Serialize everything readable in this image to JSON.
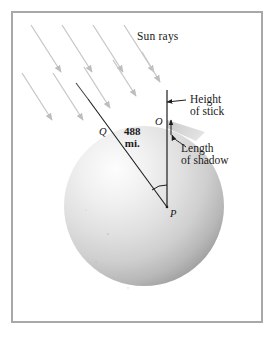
{
  "figure": {
    "frame_color": "#a8a8a8",
    "background_color": "#ffffff",
    "labels": {
      "sun_rays": "Sun rays",
      "height_line1": "Height",
      "height_line2": "of stick",
      "shadow_line1": "Length",
      "shadow_line2": "of shadow",
      "distance_value": "488",
      "distance_unit": "mi."
    },
    "points": {
      "q": "Q",
      "o": "O",
      "p": "P"
    },
    "sphere": {
      "center_x": 144,
      "center_y": 206,
      "radius": 80,
      "fill_light": "#fbfbfb",
      "fill_mid": "#d8d8d8",
      "fill_dark": "#9c9c9c"
    },
    "sun_ray_color": "#c6c6c6",
    "line_color": "#1d1d1d",
    "sun_rays_count": 9
  }
}
